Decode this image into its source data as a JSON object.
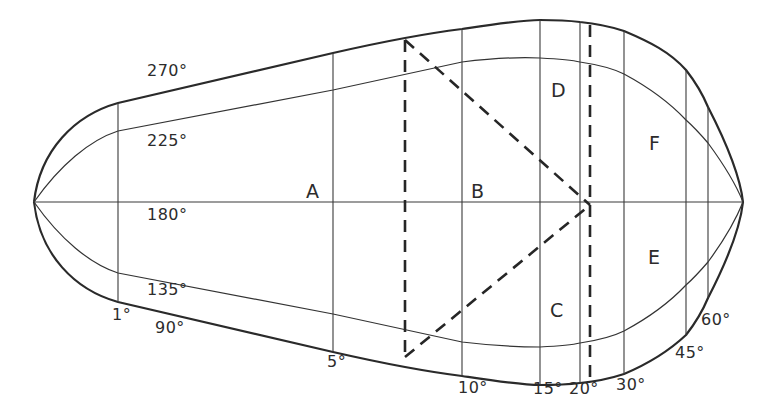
{
  "diagram": {
    "type": "closed-envelope-plot",
    "azimuth_curves": [
      {
        "label": "270°"
      },
      {
        "label": "225°"
      },
      {
        "label": "180°"
      },
      {
        "label": "135°"
      },
      {
        "label": "90°"
      }
    ],
    "angle_ticks": [
      {
        "label": "1°"
      },
      {
        "label": "5°"
      },
      {
        "label": "10°"
      },
      {
        "label": "15°"
      },
      {
        "label": "20°"
      },
      {
        "label": "30°"
      },
      {
        "label": "45°"
      },
      {
        "label": "60°"
      }
    ],
    "regions": [
      {
        "label": "A"
      },
      {
        "label": "B"
      },
      {
        "label": "C"
      },
      {
        "label": "D"
      },
      {
        "label": "E"
      },
      {
        "label": "F"
      }
    ],
    "colors": {
      "line": "#2a2a2a",
      "background": "#ffffff"
    }
  }
}
